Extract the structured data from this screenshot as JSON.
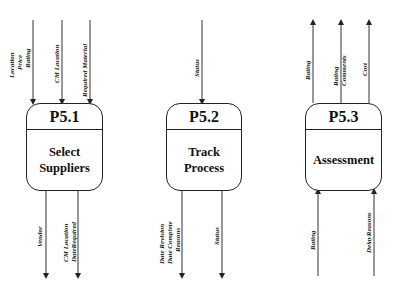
{
  "processes": [
    {
      "id": "P5.1",
      "name_lines": [
        "Select",
        "Suppliers"
      ]
    },
    {
      "id": "P5.2",
      "name_lines": [
        "Track",
        "Process"
      ]
    },
    {
      "id": "P5.3",
      "name_lines": [
        "Assessment"
      ]
    }
  ],
  "flows": {
    "p51_in": [
      {
        "lines": [
          "Location",
          "Price",
          "Rating"
        ],
        "direction": "in"
      },
      {
        "lines": [
          "CM Location"
        ],
        "direction": "in"
      },
      {
        "lines": [
          "Required Material"
        ],
        "direction": "in"
      }
    ],
    "p51_out": [
      {
        "lines": [
          "Vendor"
        ],
        "direction": "out"
      },
      {
        "lines": [
          "CM Location",
          "DateRequired"
        ],
        "direction": "out"
      }
    ],
    "p52_in": [
      {
        "lines": [
          "Status"
        ],
        "direction": "in"
      }
    ],
    "p52_out": [
      {
        "lines": [
          "Date Revision",
          "Date Complete",
          "Reasons"
        ],
        "direction": "out"
      },
      {
        "lines": [
          "Status"
        ],
        "direction": "out"
      }
    ],
    "p53_out": [
      {
        "lines": [
          "Rating"
        ],
        "direction": "out"
      },
      {
        "lines": [
          "Rating",
          "Comments"
        ],
        "direction": "out"
      },
      {
        "lines": [
          "Cost"
        ],
        "direction": "out"
      }
    ],
    "p53_in": [
      {
        "lines": [
          "Rating"
        ],
        "direction": "in"
      },
      {
        "lines": [
          "DelayReasons"
        ],
        "direction": "in"
      }
    ]
  }
}
